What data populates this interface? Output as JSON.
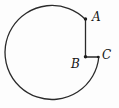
{
  "figure": {
    "type": "geometry-diagram",
    "points": [
      {
        "label": "A"
      },
      {
        "label": "B"
      },
      {
        "label": "C"
      }
    ],
    "colors": {
      "stroke": "#2a2a2a",
      "dot": "#1c1c1c",
      "label": "#141414",
      "background": "#fdfdfd"
    }
  }
}
